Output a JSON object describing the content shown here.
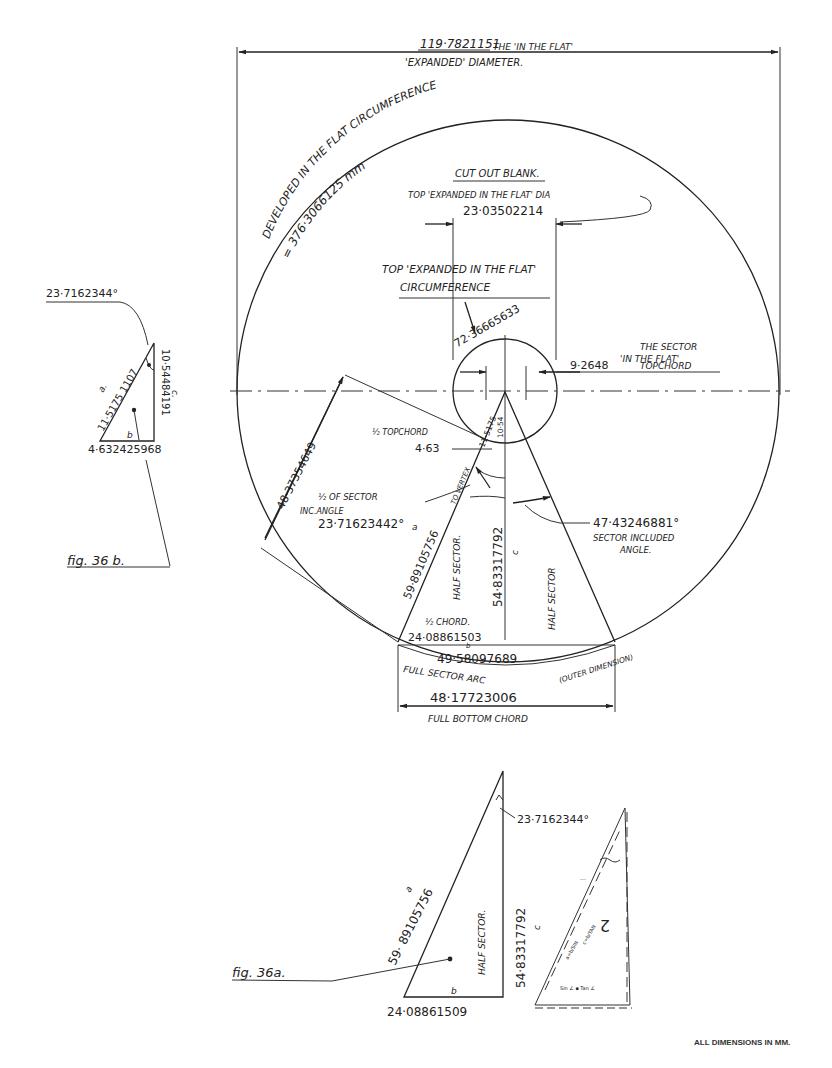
{
  "drawing": {
    "expanded_diameter": {
      "value": "119·7821151",
      "label_line1": "THE 'IN THE FLAT'",
      "label_line2": "'EXPANDED' DIAMETER."
    },
    "developed_circumference": {
      "label": "DEVELOPED IN THE FLAT CIRCUMFERENCE",
      "value": "= 376·3066125 mm"
    },
    "cut_out_blank": "CUT OUT BLANK.",
    "top_expanded_dia": {
      "label": "TOP 'EXPANDED IN THE FLAT' DIA",
      "value": "23·03502214"
    },
    "top_expanded_circumference": {
      "label_line1": "TOP 'EXPANDED IN THE FLAT'",
      "label_line2": "CIRCUMFERENCE",
      "value": "72·36665633"
    },
    "sector_top_chord": {
      "label_line1": "THE SECTOR",
      "label_line2": "'IN THE FLAT'",
      "value": "9·2648",
      "suffix": "TOPCHORD"
    },
    "small_a": "11·5175",
    "small_c": "10·54",
    "outer_radius": "48·37354649",
    "half_top_chord": {
      "label": "½ TOPCHORD",
      "value": "4·63"
    },
    "half_sector_angle": {
      "label_line1": "½ OF SECTOR",
      "label_line2": "INC.ANGLE",
      "value": "23·71623442°"
    },
    "slant_to_vertex": {
      "value": "59·89105756",
      "suffix": "TO VERTEX",
      "letter": "a"
    },
    "sector_height": {
      "value": "54·83317792",
      "letter": "c"
    },
    "sector_included_angle": {
      "value": "47·43246881°",
      "label_line1": "SECTOR INCLUDED",
      "label_line2": "ANGLE."
    },
    "half_sector_left": "HALF SECTOR.",
    "half_sector_right": "HALF SECTOR",
    "half_chord": {
      "label": "½ CHORD.",
      "value": "24·08861503",
      "letter": "b"
    },
    "full_sector_arc": {
      "value": "49·58097689",
      "label": "FULL SECTOR ARC",
      "note": "(OUTER DIMENSION)"
    },
    "full_bottom_chord": {
      "value": "48·17723006",
      "label": "FULL BOTTOM CHORD"
    }
  },
  "fig_36b": {
    "caption": "fig. 36 b.",
    "angle": "23·7162344°",
    "a": "11·5175 1107",
    "a_letter": "a.",
    "c": "10·54484191",
    "c_letter": "c.",
    "b_letter": "b",
    "b": "4·632425968"
  },
  "fig_36a": {
    "caption": "fig. 36a.",
    "a_letter": "a",
    "a": "59· 89105756",
    "label": "HALF SECTOR.",
    "c": "54·83317792",
    "c_letter": "c",
    "b_letter": "b",
    "b": "24·08861509",
    "angle": "23·7162344°"
  },
  "footer": {
    "note": "ALL DIMENSIONS IN MM."
  }
}
